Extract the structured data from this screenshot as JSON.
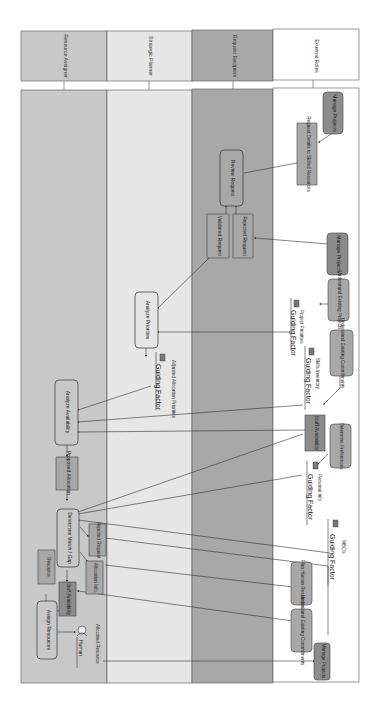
{
  "diagram": {
    "orientation": "rotated-90-clockwise",
    "lanes": [
      {
        "id": "resource-assigner",
        "label": "Resource Assigner",
        "color": "#c8c8c8"
      },
      {
        "id": "strategic-planner",
        "label": "Strategic Planner",
        "color": "#e6e6e6"
      },
      {
        "id": "request-recipient",
        "label": "Request Recipient",
        "color": "#a8a8a8"
      },
      {
        "id": "external-roles",
        "label": "External Roles",
        "color": "#ffffff"
      }
    ],
    "nodes": {
      "manage_projects_1": "Manage Projects",
      "request_details": "Request Details to Skilled Resources",
      "review_request": "Review Request",
      "rejected_request_1": "Rejected Request",
      "validated_request": "Validated Request",
      "manage_projects_2": "Manage Projects",
      "understand_existing_projects": "Understand Existing Projects",
      "analyze_priorities": "Analyze Priorities",
      "understand_existing_commitments_1": "Understand Existing Commitments",
      "analyze_availability": "Analyze Availability",
      "staff_availability_1": "Staff Availability",
      "determine_preferences": "Determine Preferences",
      "proposed_allocation": "Proposed Allocation",
      "determine_match_gap": "Determine Match / Gap",
      "rejected_request_2": "Rejected Request",
      "allocation_info": "Allocation Info.",
      "resource": "Resource",
      "staff_availability_2": "Staff Availability",
      "assign_resources": "Assign Resources",
      "plan_human_resources": "Plan Human Resources",
      "understand_existing_commitments_2": "Understand Existing Commitments",
      "manage_projects_3": "Manage Projects"
    },
    "guiding_factors": {
      "project_priorities": {
        "caption": "Project Priorities",
        "label": "Guiding Factor"
      },
      "adjusted_allocation": {
        "caption": "Adjusted Allocation Priorities",
        "label": "Guiding Factor"
      },
      "skills_inventory": {
        "caption": "Skills Inventory",
        "label": "Guiding Factor"
      },
      "personal_info": {
        "caption": "Personal Info",
        "label": "Guiding Factor"
      },
      "mbos": {
        "caption": "MBO's",
        "label": "Guiding Factor"
      }
    },
    "human": {
      "caption": "Allocated Resource",
      "label": "Human"
    }
  }
}
